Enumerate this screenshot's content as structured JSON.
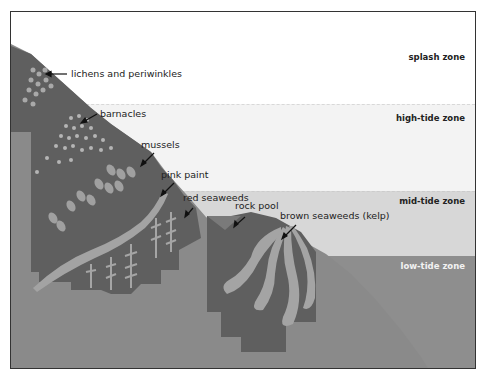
{
  "diagram": {
    "zones": [
      {
        "id": "splash",
        "label": "splash zone"
      },
      {
        "id": "high",
        "label": "high-tide zone"
      },
      {
        "id": "mid",
        "label": "mid-tide zone"
      },
      {
        "id": "low",
        "label": "low-tide zone"
      }
    ],
    "callouts": [
      {
        "id": "lichens",
        "label": "lichens and periwinkles"
      },
      {
        "id": "barnacles",
        "label": "barnacles"
      },
      {
        "id": "mussels",
        "label": "mussels"
      },
      {
        "id": "pink-paint",
        "label": "pink paint"
      },
      {
        "id": "red-seaweeds",
        "label": "red seaweeds"
      },
      {
        "id": "rock-pool",
        "label": "rock pool"
      },
      {
        "id": "kelp",
        "label": "brown seaweeds (kelp)"
      }
    ],
    "colors": {
      "splash_band": "#ffffff",
      "high_band": "#f3f3f3",
      "mid_band": "#d7d7d7",
      "low_band": "#8e8e8e",
      "rock": "#8a8a8a",
      "rock_dark": "#5e5e5e",
      "organism_light": "#a8a8a8",
      "border": "#333333"
    }
  }
}
